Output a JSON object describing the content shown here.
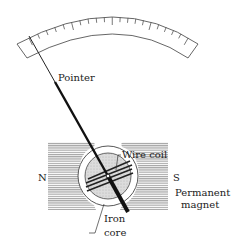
{
  "diagram": {
    "labels": {
      "pointer": "Pointer",
      "wire_coil": "Wire coil",
      "north": "N",
      "south": "S",
      "permanent_magnet_1": "Permanent",
      "permanent_magnet_2": "magnet",
      "iron_core_1": "Iron",
      "iron_core_2": "core"
    },
    "scale": {
      "tick_count": 21
    },
    "colors": {
      "ink": "#222222",
      "magnet_hatch": "#8a8a8a",
      "core_fill": "#d6d6d6"
    }
  }
}
